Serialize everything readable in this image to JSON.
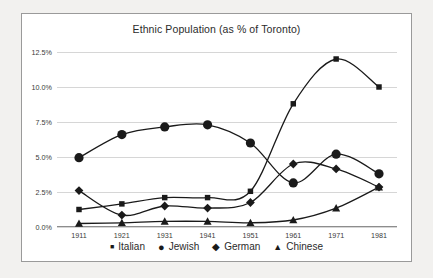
{
  "chart_data": {
    "type": "line",
    "title": "Ethnic Population (as % of Toronto)",
    "xlabel": "",
    "ylabel": "",
    "categories": [
      "1911",
      "1921",
      "1931",
      "1941",
      "1951",
      "1961",
      "1971",
      "1981"
    ],
    "ylim": [
      0,
      12.5
    ],
    "ytick_labels": [
      "0.0%",
      "2.5%",
      "5.0%",
      "7.5%",
      "10.0%",
      "12.5%"
    ],
    "ytick_values": [
      0,
      2.5,
      5,
      7.5,
      10,
      12.5
    ],
    "grid": true,
    "legend_position": "bottom",
    "series": [
      {
        "name": "Italian",
        "marker": "square",
        "color": "#1a1a1a",
        "values": [
          1.25,
          1.65,
          2.1,
          2.1,
          2.55,
          8.8,
          12.0,
          10.0
        ]
      },
      {
        "name": "Jewish",
        "marker": "circle",
        "color": "#1a1a1a",
        "values": [
          4.95,
          6.6,
          7.15,
          7.3,
          6.0,
          3.15,
          5.2,
          3.8
        ]
      },
      {
        "name": "German",
        "marker": "diamond",
        "color": "#1a1a1a",
        "values": [
          2.6,
          0.85,
          1.5,
          1.35,
          1.75,
          4.5,
          4.15,
          2.85
        ]
      },
      {
        "name": "Chinese",
        "marker": "triangle",
        "color": "#1a1a1a",
        "values": [
          0.25,
          0.3,
          0.4,
          0.4,
          0.3,
          0.5,
          1.35,
          2.85
        ]
      }
    ]
  },
  "colors": {
    "page_background": "#f2f1ef",
    "panel_background": "#ffffff",
    "frame_border": "#9a9a9a",
    "gridline": "#d6d6d6",
    "axis": "#8d8d8d",
    "text": "#2b2b2b",
    "series": "#1a1a1a"
  }
}
